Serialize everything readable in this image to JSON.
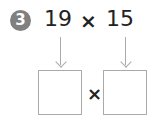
{
  "problem": {
    "number": "3",
    "left_operand": "19",
    "operator": "×",
    "right_operand": "15"
  },
  "answer": {
    "box1_value": "",
    "operator": "×",
    "box2_value": ""
  },
  "colors": {
    "badge": "#808080",
    "arrows": "#aaaaaa",
    "text": "#222222"
  }
}
